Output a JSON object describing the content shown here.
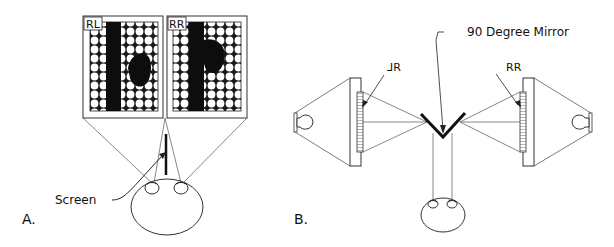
{
  "panel_a": {
    "label": "A.",
    "screen_label": "Screen",
    "left_image_label": "RL",
    "right_image_label": "RR"
  },
  "panel_b": {
    "label": "B.",
    "mirror_label": "90 Degree Mirror",
    "left_display_label": "⅃R",
    "right_display_label": "RR"
  }
}
